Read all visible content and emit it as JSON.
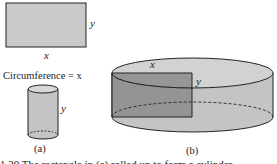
{
  "figure": {
    "panel_a": {
      "rectangle": {
        "width_label": "x",
        "height_label": "y"
      },
      "circumference_label": "Circumference = x",
      "cylinder": {
        "height_label": "y"
      },
      "caption": "(a)"
    },
    "panel_b": {
      "rectangle": {
        "width_label": "x",
        "height_label": "y"
      },
      "caption": "(b)"
    },
    "caption_partial": "1.30   The rectangle in (a) rolled up to form a cylinder"
  },
  "colors": {
    "fill_light": "#c9c9c9",
    "fill_mid": "#b8b8b8",
    "fill_dark": "#8c8c8c",
    "stroke": "#222222"
  }
}
